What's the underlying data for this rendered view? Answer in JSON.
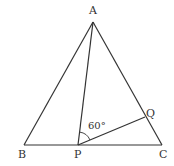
{
  "diagram": {
    "type": "geometry",
    "colors": {
      "stroke": "#333333",
      "background": "#ffffff"
    },
    "points": {
      "A": {
        "label": "A",
        "x": 93,
        "y": 22
      },
      "B": {
        "label": "B",
        "x": 24,
        "y": 145
      },
      "C": {
        "label": "C",
        "x": 162,
        "y": 145
      },
      "P": {
        "label": "P",
        "x": 78,
        "y": 145
      },
      "Q": {
        "label": "Q",
        "x": 145,
        "y": 117
      }
    },
    "segments": [
      "AB",
      "AC",
      "BC",
      "AP",
      "PQ"
    ],
    "angle": {
      "vertex": "P",
      "between": [
        "A",
        "Q"
      ],
      "label": "60°"
    }
  }
}
